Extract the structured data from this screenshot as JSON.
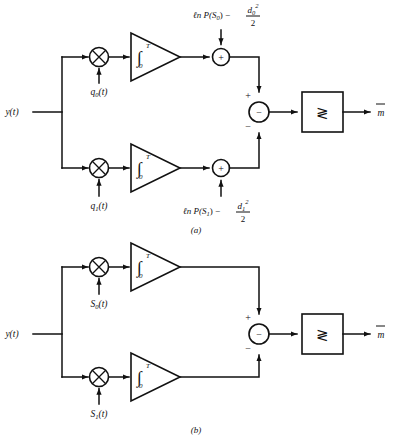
{
  "figure": {
    "subfigures": [
      {
        "caption": "(a)",
        "input_label": "y(t)",
        "output_label": "m",
        "output_accent": "hat",
        "branches": [
          {
            "multiplier_icon": "multiplier-circle-x",
            "reference_label": "q",
            "reference_sub": "0",
            "reference_suffix": "(t)",
            "integrator_symbol": "∫",
            "integrator_upper_limit": "T",
            "integrator_lower_limit": "0",
            "adder_icon": "adder-circle-plus",
            "adder_sign": "+",
            "bias_prefix": "ℓn P(S",
            "bias_sub": "0",
            "bias_mid": ") −",
            "bias_num": "d",
            "bias_num_sub": "0",
            "bias_num_sup": "2",
            "bias_den": "2"
          },
          {
            "multiplier_icon": "multiplier-circle-x",
            "reference_label": "q",
            "reference_sub": "1",
            "reference_suffix": "(t)",
            "integrator_symbol": "∫",
            "integrator_upper_limit": "T",
            "integrator_lower_limit": "0",
            "adder_icon": "adder-circle-plus",
            "adder_sign": "+",
            "bias_prefix": "ℓn P(S",
            "bias_sub": "1",
            "bias_mid": ") −",
            "bias_num": "d",
            "bias_num_sub": "1",
            "bias_num_sup": "2",
            "bias_den": "2"
          }
        ],
        "subtractor": {
          "icon": "subtractor-circle-minus",
          "inner_sign": "−",
          "top_sign": "+",
          "bottom_sign": "−"
        },
        "comparator": {
          "icon": "comparator-box",
          "symbol": "≷"
        }
      },
      {
        "caption": "(b)",
        "input_label": "y(t)",
        "output_label": "m",
        "output_accent": "hat",
        "branches": [
          {
            "multiplier_icon": "multiplier-circle-x",
            "reference_label": "S",
            "reference_sub": "0",
            "reference_suffix": "(t)",
            "integrator_symbol": "∫",
            "integrator_upper_limit": "T",
            "integrator_lower_limit": "0"
          },
          {
            "multiplier_icon": "multiplier-circle-x",
            "reference_label": "S",
            "reference_sub": "1",
            "reference_suffix": "(t)",
            "integrator_symbol": "∫",
            "integrator_upper_limit": "T",
            "integrator_lower_limit": "0"
          }
        ],
        "subtractor": {
          "icon": "subtractor-circle-minus",
          "inner_sign": "−",
          "top_sign": "+",
          "bottom_sign": "−"
        },
        "comparator": {
          "icon": "comparator-box",
          "symbol": "≷"
        }
      }
    ]
  },
  "colors": {
    "ink": "#111111",
    "paper": "#ffffff"
  }
}
